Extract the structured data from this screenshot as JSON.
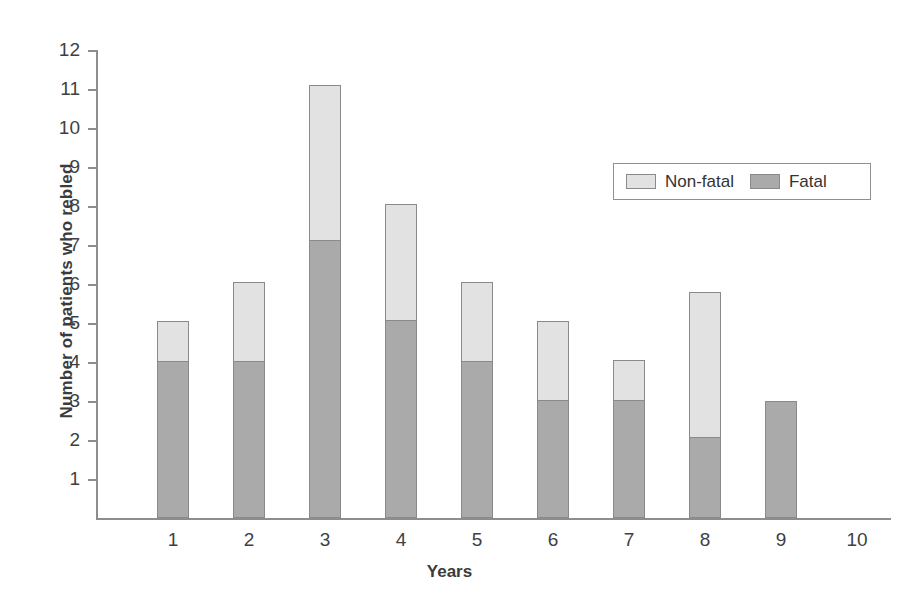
{
  "chart_data": {
    "type": "bar",
    "stacked": true,
    "title": "",
    "xlabel": "Years",
    "ylabel": "Number of patients who rebled",
    "categories": [
      "1",
      "2",
      "3",
      "4",
      "5",
      "6",
      "7",
      "8",
      "9",
      "10"
    ],
    "xtick_labels": [
      "1",
      "2",
      "3",
      "4",
      "5",
      "6",
      "7",
      "8",
      "9",
      "10"
    ],
    "ytick_labels": [
      "12",
      "11",
      "10",
      "9",
      "8",
      "7",
      "6",
      "5",
      "4",
      "3",
      "2",
      "1"
    ],
    "ylim": [
      0,
      12
    ],
    "xlim_categories": 10,
    "grid": false,
    "legend_position": "upper-right-inside",
    "series": [
      {
        "name": "Fatal",
        "color": "#aaaaaa",
        "values": [
          4.0,
          4.0,
          7.1,
          5.05,
          4.0,
          3.0,
          3.0,
          2.05,
          3.0,
          0
        ]
      },
      {
        "name": "Non-fatal",
        "color": "#e2e2e2",
        "values": [
          1.05,
          2.05,
          4.0,
          3.0,
          2.05,
          2.05,
          1.05,
          3.75,
          0,
          0
        ]
      }
    ],
    "totals": [
      5.05,
      6.05,
      11.1,
      8.05,
      6.05,
      5.05,
      4.05,
      5.8,
      3.0,
      0
    ]
  },
  "legend": {
    "items": [
      {
        "label": "Non-fatal",
        "swatch": "nonfatal"
      },
      {
        "label": "Fatal",
        "swatch": "fatal"
      }
    ]
  },
  "colors": {
    "fatal": "#aaaaaa",
    "nonfatal": "#e2e2e2",
    "axis": "#8d8d8d",
    "text": "#3b3b3b",
    "background": "#ffffff"
  }
}
